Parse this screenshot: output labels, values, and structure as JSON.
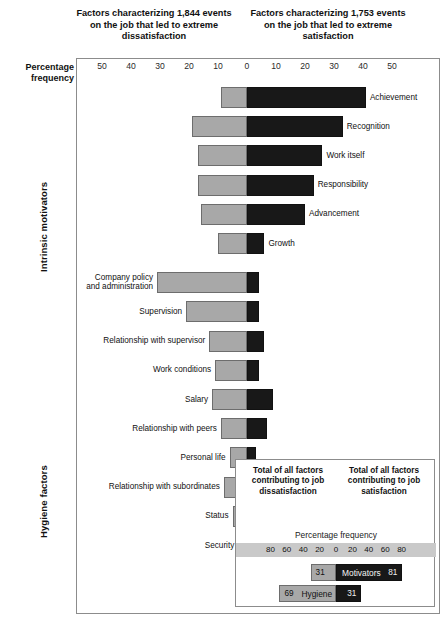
{
  "headings": {
    "dissatisfaction": "Factors characterizing 1,844 events on the job that led to extreme dissatisfaction",
    "satisfaction": "Factors characterizing 1,753 events on the job that led to extreme satisfaction"
  },
  "axis_label": "Percentage frequency",
  "side_labels": {
    "intrinsic": "Intrinsic motivators",
    "hygiene": "Hygiene factors"
  },
  "chart_data": {
    "type": "bar",
    "orientation": "horizontal-diverging",
    "xlabel": "Percentage frequency",
    "ylabel": "",
    "xlim": [
      -55,
      55
    ],
    "grid": false,
    "legend_position": "inset-bottom-right",
    "axis_ticks": [
      {
        "label": "50",
        "value": -50
      },
      {
        "label": "40",
        "value": -40
      },
      {
        "label": "30",
        "value": -30
      },
      {
        "label": "20",
        "value": -20
      },
      {
        "label": "10",
        "value": -10
      },
      {
        "label": "0",
        "value": 0
      },
      {
        "label": "10",
        "value": 10
      },
      {
        "label": "20",
        "value": 20
      },
      {
        "label": "30",
        "value": 30
      },
      {
        "label": "40",
        "value": 40
      },
      {
        "label": "50",
        "value": 50
      }
    ],
    "series": [
      {
        "name": "Dissatisfaction (hygiene side)",
        "color": "#a8a8a8",
        "direction": "left"
      },
      {
        "name": "Satisfaction (motivator side)",
        "color": "#181818",
        "direction": "right"
      }
    ],
    "categories": [
      {
        "label": "Achievement",
        "group": "Intrinsic motivators",
        "label_side": "right",
        "dissatisfaction": 9,
        "satisfaction": 41
      },
      {
        "label": "Recognition",
        "group": "Intrinsic motivators",
        "label_side": "right",
        "dissatisfaction": 19,
        "satisfaction": 33
      },
      {
        "label": "Work itself",
        "group": "Intrinsic motivators",
        "label_side": "right",
        "dissatisfaction": 17,
        "satisfaction": 26
      },
      {
        "label": "Responsibility",
        "group": "Intrinsic motivators",
        "label_side": "right",
        "dissatisfaction": 17,
        "satisfaction": 23
      },
      {
        "label": "Advancement",
        "group": "Intrinsic motivators",
        "label_side": "right",
        "dissatisfaction": 16,
        "satisfaction": 20
      },
      {
        "label": "Growth",
        "group": "Intrinsic motivators",
        "label_side": "right",
        "dissatisfaction": 10,
        "satisfaction": 6
      },
      {
        "label": "Company policy\nand administration",
        "group": "Hygiene factors",
        "label_side": "left",
        "dissatisfaction": 31,
        "satisfaction": 4
      },
      {
        "label": "Supervision",
        "group": "Hygiene factors",
        "label_side": "left",
        "dissatisfaction": 21,
        "satisfaction": 4
      },
      {
        "label": "Relationship with supervisor",
        "group": "Hygiene factors",
        "label_side": "left",
        "dissatisfaction": 13,
        "satisfaction": 6
      },
      {
        "label": "Work conditions",
        "group": "Hygiene factors",
        "label_side": "left",
        "dissatisfaction": 11,
        "satisfaction": 4
      },
      {
        "label": "Salary",
        "group": "Hygiene factors",
        "label_side": "left",
        "dissatisfaction": 12,
        "satisfaction": 9
      },
      {
        "label": "Relationship with peers",
        "group": "Hygiene factors",
        "label_side": "left",
        "dissatisfaction": 9,
        "satisfaction": 7
      },
      {
        "label": "Personal life",
        "group": "Hygiene factors",
        "label_side": "left",
        "dissatisfaction": 6,
        "satisfaction": 3
      },
      {
        "label": "Relationship with subordinates",
        "group": "Hygiene factors",
        "label_side": "left",
        "dissatisfaction": 8,
        "satisfaction": 8
      },
      {
        "label": "Status",
        "group": "Hygiene factors",
        "label_side": "left",
        "dissatisfaction": 5,
        "satisfaction": 3
      },
      {
        "label": "Security",
        "group": "Hygiene factors",
        "label_side": "left",
        "dissatisfaction": 3,
        "satisfaction": 2
      }
    ]
  },
  "legend": {
    "title_dissatisfaction": "Total of all factors contributing to job dissatisfaction",
    "title_satisfaction": "Total of all factors contributing to job satisfaction",
    "scale_caption": "Percentage frequency",
    "axis_ticks": [
      {
        "label": "80",
        "value": -80
      },
      {
        "label": "60",
        "value": -60
      },
      {
        "label": "40",
        "value": -40
      },
      {
        "label": "20",
        "value": -20
      },
      {
        "label": "0",
        "value": 0
      },
      {
        "label": "20",
        "value": 20
      },
      {
        "label": "40",
        "value": 40
      },
      {
        "label": "60",
        "value": 60
      },
      {
        "label": "80",
        "value": 80
      }
    ],
    "rows": [
      {
        "name": "Motivators",
        "dissatisfaction": 31,
        "satisfaction": 81,
        "name_on": "dark"
      },
      {
        "name": "Hygiene",
        "dissatisfaction": 69,
        "satisfaction": 31,
        "name_on": "light"
      }
    ]
  },
  "colors": {
    "dissatisfaction_bar": "#a8a8a8",
    "satisfaction_bar": "#181818",
    "frame": "#8c8c8c",
    "legend_strip": "#c9c9c9"
  }
}
